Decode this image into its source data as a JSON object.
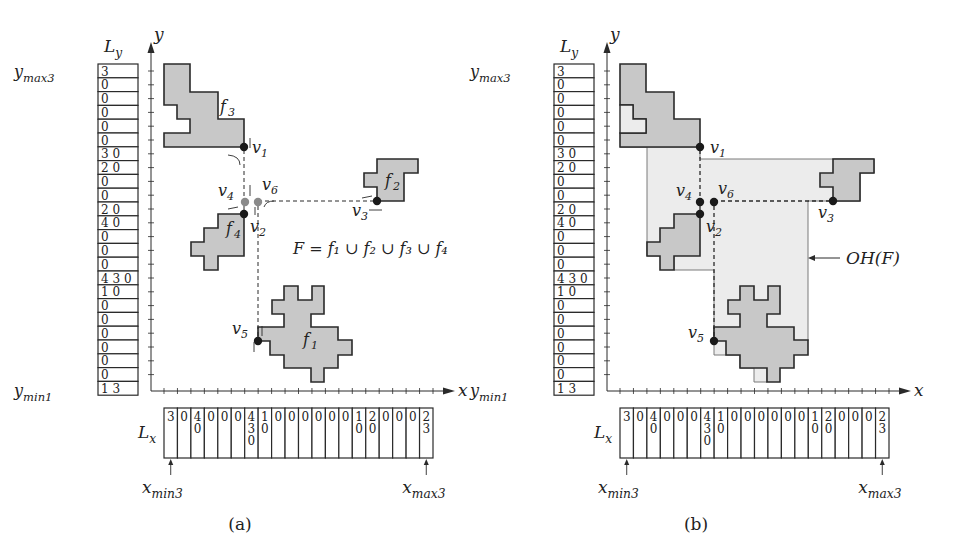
{
  "panels": [
    {
      "id": "a",
      "caption": "(a)",
      "ly_label": "L",
      "ly_sub": "y",
      "lx_label": "L",
      "lx_sub": "x",
      "y_axis_label": "y",
      "x_axis_label": "x",
      "ymax_label": "y",
      "ymax_sub": "max3",
      "ymin_label": "y",
      "ymin_sub": "min1",
      "xmin_label": "x",
      "xmin_sub": "min3",
      "xmax_label": "x",
      "xmax_sub": "max3",
      "ly_cells": [
        "3",
        "0",
        "0",
        "0",
        "0",
        "0",
        "3 0",
        "2 0",
        "0",
        "0",
        "2 0",
        "4 0",
        "0",
        "0",
        "0",
        "4 3 0",
        "1 0",
        "0",
        "0",
        "0",
        "0",
        "0",
        "0",
        "1 3"
      ],
      "lx_cells": [
        [
          "3"
        ],
        [
          "0"
        ],
        [
          "4",
          "0"
        ],
        [
          "0"
        ],
        [
          "0"
        ],
        [
          "0"
        ],
        [
          "4",
          "3",
          "0"
        ],
        [
          "1",
          "0"
        ],
        [
          "0"
        ],
        [
          "0"
        ],
        [
          "0"
        ],
        [
          "0"
        ],
        [
          "0"
        ],
        [
          "0"
        ],
        [
          "1",
          "0"
        ],
        [
          "2",
          "0"
        ],
        [
          "0"
        ],
        [
          "0"
        ],
        [
          "0"
        ],
        [
          "2",
          "3"
        ]
      ],
      "faces": [
        "f3",
        "f2",
        "f4",
        "f1"
      ],
      "vertices": [
        "v1",
        "v2",
        "v3",
        "v4",
        "v5",
        "v6"
      ],
      "formula": "F = f₁ ∪ f₂ ∪ f₃ ∪ f₄"
    },
    {
      "id": "b",
      "caption": "(b)",
      "ly_label": "L",
      "ly_sub": "y",
      "lx_label": "L",
      "lx_sub": "x",
      "y_axis_label": "y",
      "x_axis_label": "x",
      "ymax_label": "y",
      "ymax_sub": "max3",
      "ymin_label": "y",
      "ymin_sub": "min1",
      "xmin_label": "x",
      "xmin_sub": "min3",
      "xmax_label": "x",
      "xmax_sub": "max3",
      "ly_cells": [
        "3",
        "0",
        "0",
        "0",
        "0",
        "0",
        "3 0",
        "2 0",
        "0",
        "0",
        "2 0",
        "4 0",
        "0",
        "0",
        "0",
        "4 3 0",
        "1 0",
        "0",
        "0",
        "0",
        "0",
        "0",
        "0",
        "1 3"
      ],
      "lx_cells": [
        [
          "3"
        ],
        [
          "0"
        ],
        [
          "4",
          "0"
        ],
        [
          "0"
        ],
        [
          "0"
        ],
        [
          "0"
        ],
        [
          "4",
          "3",
          "0"
        ],
        [
          "1",
          "0"
        ],
        [
          "0"
        ],
        [
          "0"
        ],
        [
          "0"
        ],
        [
          "0"
        ],
        [
          "0"
        ],
        [
          "0"
        ],
        [
          "1",
          "0"
        ],
        [
          "2",
          "0"
        ],
        [
          "0"
        ],
        [
          "0"
        ],
        [
          "0"
        ],
        [
          "2",
          "3"
        ]
      ],
      "vertices": [
        "v1",
        "v2",
        "v3",
        "v4",
        "v5",
        "v6"
      ],
      "hull_label": "OH(F)"
    }
  ],
  "colors": {
    "face_fill": "#c8c8c8",
    "hull_fill": "#ececec",
    "stroke": "#2a2a2a",
    "gray_vertex": "#8a8a8a"
  }
}
